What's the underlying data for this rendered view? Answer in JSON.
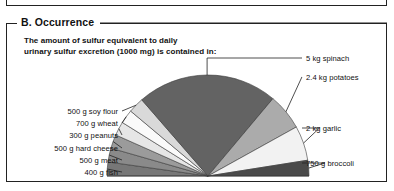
{
  "panel": {
    "legend": "B. Occurrence",
    "intro_line1": "The amount of sulfur equivalent to daily",
    "intro_line2": "urinary sulfur excretion (1000 mg) is contained in:"
  },
  "colors": {
    "ink": "#222222",
    "slice_spinach": "#636363",
    "slice_potatoes": "#ababab",
    "slice_garlic": "#f2f2f2",
    "slice_broccoli": "#4a4a4a",
    "slice_soy_flour": "#d9d9d9",
    "slice_wheat": "#fafafa",
    "slice_peanuts": "#e6e6e6",
    "slice_hard_cheese": "#9b9b9b",
    "slice_meat": "#8a8a8a",
    "slice_fish": "#777777"
  },
  "chart_data": {
    "type": "pie",
    "title": "The amount of sulfur equivalent to daily urinary sulfur excretion (1000 mg) is contained in:",
    "shape": "half-pie",
    "total_degrees": 180,
    "center_x": 208,
    "center_y": 176,
    "radius": 101,
    "labels": [
      "5 kg spinach",
      "2.4 kg potatoes",
      "2 kg garlic",
      "750 g broccoli",
      "400 g fish",
      "500 g meat",
      "500 g hard cheese",
      "300 g peanuts",
      "700 g wheat",
      "500 g soy flour"
    ],
    "slices": [
      {
        "label": "400 g fish",
        "start_deg": 180.0,
        "end_deg": 172.0,
        "sweep_deg": 8.0,
        "color": "#777777",
        "side": "left",
        "label_y": 172
      },
      {
        "label": "500 g meat",
        "start_deg": 172.0,
        "end_deg": 164.0,
        "sweep_deg": 8.0,
        "color": "#8a8a8a",
        "side": "left",
        "label_y": 160
      },
      {
        "label": "500 g hard cheese",
        "start_deg": 164.0,
        "end_deg": 156.0,
        "sweep_deg": 8.0,
        "color": "#9b9b9b",
        "side": "left",
        "label_y": 148
      },
      {
        "label": "300 g peanuts",
        "start_deg": 156.0,
        "end_deg": 148.0,
        "sweep_deg": 8.0,
        "color": "#e6e6e6",
        "side": "left",
        "label_y": 135
      },
      {
        "label": "700 g wheat",
        "start_deg": 148.0,
        "end_deg": 140.0,
        "sweep_deg": 8.0,
        "color": "#fafafa",
        "side": "left",
        "label_y": 123
      },
      {
        "label": "500 g soy flour",
        "start_deg": 140.0,
        "end_deg": 131.0,
        "sweep_deg": 9.0,
        "color": "#d9d9d9",
        "side": "left",
        "label_y": 111
      },
      {
        "label": "5 kg spinach",
        "start_deg": 131.0,
        "end_deg": 50.0,
        "sweep_deg": 81.0,
        "color": "#636363",
        "side": "right",
        "label_y": 58
      },
      {
        "label": "2.4 kg potatoes",
        "start_deg": 50.0,
        "end_deg": 29.0,
        "sweep_deg": 21.0,
        "color": "#ababab",
        "side": "right",
        "label_y": 77
      },
      {
        "label": "2 kg garlic",
        "start_deg": 29.0,
        "end_deg": 9.0,
        "sweep_deg": 20.0,
        "color": "#f2f2f2",
        "side": "right",
        "label_y": 128
      },
      {
        "label": "750 g broccoli",
        "start_deg": 9.0,
        "end_deg": 0.0,
        "sweep_deg": 9.0,
        "color": "#4a4a4a",
        "side": "right",
        "label_y": 163
      }
    ],
    "left_label_x_right": 118,
    "right_label_x_left": 306
  }
}
